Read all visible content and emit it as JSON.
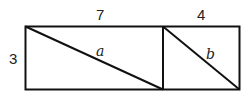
{
  "diagram": {
    "height_label": "3",
    "left_rect": {
      "width_label": "7",
      "diagonal_label": "a"
    },
    "right_rect": {
      "width_label": "4",
      "diagonal_label": "b"
    },
    "colors": {
      "stroke": "#111111",
      "background": "#ffffff"
    }
  }
}
